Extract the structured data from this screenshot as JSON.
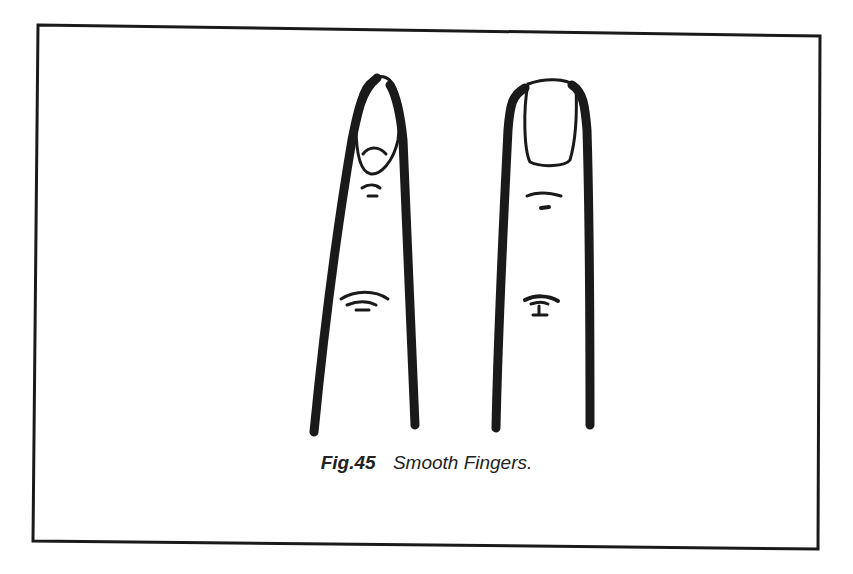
{
  "figure": {
    "label": "Fig.45",
    "title": "Smooth Fingers.",
    "illustration": {
      "subject": "two smooth fingers",
      "fingers": [
        {
          "name": "left-finger",
          "nail_shape": "oval, narrow tapered"
        },
        {
          "name": "right-finger",
          "nail_shape": "square, broad"
        }
      ]
    },
    "colors": {
      "ink": "#1a1a1a",
      "paper": "#ffffff"
    }
  }
}
